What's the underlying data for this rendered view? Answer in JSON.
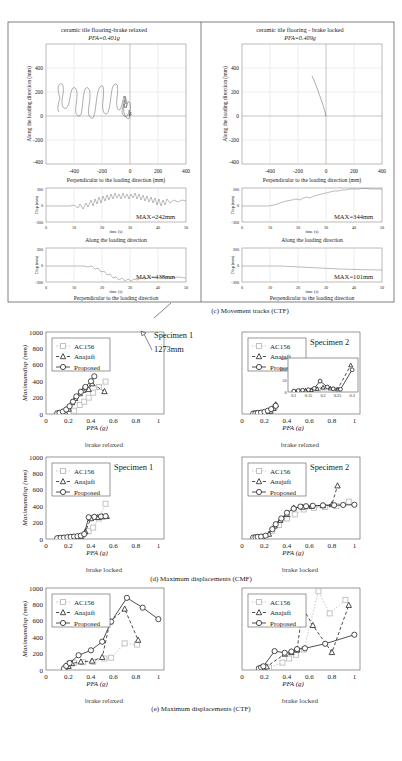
{
  "figure": {
    "panel_c_caption": "(c) Movement tracks (CTF)",
    "panel_d_caption": "(d) Maximum displacements (CMF)",
    "panel_e_caption": "(e) Maximum displacements (CTF)"
  },
  "tracks": {
    "left": {
      "title": "ceramic tile flooring-brake relaxed",
      "pfa": "PFA=0.401g",
      "ylabel": "Along the loading direction (mm)",
      "xlabel": "Perpendicular to the loading direction (mm)",
      "xticks": [
        "-400",
        "-200",
        "0",
        "200",
        "400"
      ],
      "yticks": [
        "400",
        "200",
        "0",
        "-200",
        "-400"
      ],
      "ts_along": {
        "max_label": "MAX=242mm",
        "caption": "Along the loading direction",
        "ylabel": "Disp (mm)",
        "xlabel": "time (s)",
        "yticks": [
          "300",
          "0",
          "-300"
        ],
        "xticks": [
          "0",
          "10",
          "20",
          "30",
          "40",
          "50"
        ]
      },
      "ts_perp": {
        "max_label": "MAX=438mm",
        "caption": "Perpendicular to the loading direction",
        "ylabel": "Disp (mm)",
        "xlabel": "time (s)",
        "yticks": [
          "300",
          "0",
          "-300"
        ],
        "xticks": [
          "0",
          "10",
          "20",
          "30",
          "40",
          "50"
        ]
      }
    },
    "right": {
      "title": "ceramic tile flooring - brake locked",
      "pfa": "PFA=0.409g",
      "ylabel": "Along the loading direction (mm)",
      "xlabel": "Perpendicular to the loading direction (mm)",
      "xticks": [
        "-400",
        "-200",
        "0",
        "200",
        "400"
      ],
      "yticks": [
        "400",
        "200",
        "0",
        "-200",
        "-400"
      ],
      "ts_along": {
        "max_label": "MAX=344mm",
        "caption": "Along the loading direction",
        "ylabel": "Disp (mm)",
        "xlabel": "time (s)",
        "yticks": [
          "300",
          "0",
          "-300"
        ],
        "xticks": [
          "0",
          "10",
          "20",
          "30",
          "40",
          "50"
        ]
      },
      "ts_perp": {
        "max_label": "MAX=101mm",
        "caption": "Perpendicular to the loading direction",
        "ylabel": "Disp (mm)",
        "xlabel": "time (s)",
        "yticks": [
          "300",
          "0",
          "-300"
        ],
        "xticks": [
          "0",
          "10",
          "20",
          "30",
          "40",
          "50"
        ]
      }
    }
  },
  "legend": {
    "ac156": "AC156",
    "anajafi": "Anajafi",
    "proposed": "Proposed"
  },
  "annotations": {
    "specimen1": "Specimen 1",
    "specimen2": "Specimen 2",
    "value_1273": "1273mm",
    "brake_relaxed": "brake relaxed",
    "brake_locked": "brake locked"
  },
  "axes": {
    "ylabel": "Maximumdisp (mm)",
    "xlabel": "PFA (g)",
    "xticks": [
      "0",
      "0.2",
      "0.4",
      "0.6",
      "0.8",
      "1"
    ],
    "yticks": [
      "0",
      "200",
      "400",
      "600",
      "800",
      "1000"
    ],
    "xlim": [
      0,
      1.05
    ],
    "ylim": [
      0,
      1000
    ]
  },
  "inset": {
    "xticks": [
      "0.1",
      "0.15",
      "0.2",
      "0.25",
      "0.3"
    ],
    "yticks": [
      "0",
      "50",
      "100",
      "150"
    ],
    "xlim": [
      0.08,
      0.32
    ],
    "ylim": [
      0,
      150
    ]
  },
  "colors": {
    "proposed": "#222222",
    "anajafi": "#222222",
    "ac156": "#bdbdbd",
    "frame": "#555555",
    "grid": "#cfcfcf"
  },
  "chart_data": [
    {
      "id": "d-s1-relaxed",
      "type": "scatter",
      "title": "Specimen 1 - brake relaxed (CMF)",
      "xlabel": "PFA (g)",
      "ylabel": "Maximumdisp (mm)",
      "xlim": [
        0,
        1.05
      ],
      "ylim": [
        0,
        1000
      ],
      "series": [
        {
          "name": "Proposed",
          "x": [
            0.1,
            0.12,
            0.15,
            0.18,
            0.21,
            0.24,
            0.27,
            0.31,
            0.35,
            0.4,
            0.43
          ],
          "y": [
            8,
            15,
            30,
            55,
            95,
            150,
            215,
            270,
            330,
            400,
            460
          ]
        },
        {
          "name": "Anajafi",
          "x": [
            0.11,
            0.14,
            0.17,
            0.2,
            0.23,
            0.26,
            0.3,
            0.33,
            0.38,
            0.41,
            0.52
          ],
          "y": [
            5,
            12,
            25,
            60,
            140,
            190,
            250,
            290,
            300,
            370,
            275
          ]
        },
        {
          "name": "AC156",
          "x": [
            0.12,
            0.16,
            0.2,
            0.25,
            0.3,
            0.34,
            0.38,
            0.42,
            0.47,
            0.53
          ],
          "y": [
            4,
            10,
            20,
            40,
            110,
            150,
            200,
            260,
            330,
            395
          ]
        }
      ]
    },
    {
      "id": "d-s2-relaxed",
      "type": "scatter",
      "title": "Specimen 2 - brake relaxed (CMF)",
      "xlabel": "PFA (g)",
      "ylabel": "Maximumdisp (mm)",
      "xlim": [
        0,
        1.05
      ],
      "ylim": [
        0,
        1000
      ],
      "series": [
        {
          "name": "Proposed",
          "x": [
            0.1,
            0.12,
            0.14,
            0.17,
            0.2,
            0.23,
            0.26,
            0.3
          ],
          "y": [
            5,
            8,
            12,
            18,
            25,
            40,
            60,
            100
          ]
        },
        {
          "name": "Anajafi",
          "x": [
            0.11,
            0.13,
            0.16,
            0.19,
            0.22,
            0.25,
            0.28,
            0.3
          ],
          "y": [
            4,
            7,
            10,
            14,
            22,
            35,
            70,
            115
          ]
        },
        {
          "name": "AC156",
          "x": [
            0.11,
            0.14,
            0.18,
            0.22,
            0.26,
            0.29
          ],
          "y": [
            3,
            6,
            9,
            15,
            30,
            80
          ]
        }
      ],
      "inset": {
        "xlim": [
          0.08,
          0.32
        ],
        "ylim": [
          0,
          150
        ],
        "xticks": [
          "0.1",
          "0.15",
          "0.2",
          "0.25",
          "0.3"
        ],
        "yticks": [
          "0",
          "50",
          "100",
          "150"
        ],
        "series": [
          {
            "name": "Proposed",
            "x": [
              0.1,
              0.115,
              0.13,
              0.15,
              0.17,
              0.19,
              0.215,
              0.235,
              0.26,
              0.3
            ],
            "y": [
              4,
              6,
              8,
              10,
              16,
              48,
              22,
              14,
              12,
              98
            ]
          },
          {
            "name": "Anajafi",
            "x": [
              0.1,
              0.12,
              0.14,
              0.16,
              0.18,
              0.2,
              0.225,
              0.25,
              0.295
            ],
            "y": [
              3,
              5,
              7,
              9,
              14,
              20,
              16,
              12,
              118
            ]
          },
          {
            "name": "AC156",
            "x": [
              0.105,
              0.125,
              0.155,
              0.185,
              0.205,
              0.24
            ],
            "y": [
              3,
              4,
              6,
              11,
              17,
              13
            ]
          }
        ]
      }
    },
    {
      "id": "d-s1-locked",
      "type": "scatter",
      "title": "Specimen 1 - brake locked (CMF)",
      "xlabel": "PFA (g)",
      "ylabel": "Maximumdisp (mm)",
      "xlim": [
        0,
        1.05
      ],
      "ylim": [
        0,
        1000
      ],
      "series": [
        {
          "name": "Proposed",
          "x": [
            0.1,
            0.13,
            0.16,
            0.19,
            0.22,
            0.25,
            0.28,
            0.31,
            0.34,
            0.38,
            0.43,
            0.49,
            0.53
          ],
          "y": [
            10,
            14,
            18,
            22,
            26,
            30,
            34,
            40,
            60,
            265,
            270,
            275,
            278
          ]
        },
        {
          "name": "Anajafi",
          "x": [
            0.11,
            0.15,
            0.19,
            0.23,
            0.27,
            0.31,
            0.35,
            0.4,
            0.46,
            0.5,
            0.54
          ],
          "y": [
            8,
            12,
            16,
            20,
            24,
            30,
            90,
            250,
            265,
            272,
            276
          ]
        },
        {
          "name": "AC156",
          "x": [
            0.12,
            0.17,
            0.22,
            0.27,
            0.32,
            0.38,
            0.42,
            0.47,
            0.53
          ],
          "y": [
            6,
            10,
            16,
            22,
            28,
            95,
            140,
            250,
            430
          ]
        }
      ]
    },
    {
      "id": "d-s2-locked",
      "type": "scatter",
      "title": "Specimen 2 - brake locked (CMF)",
      "xlabel": "PFA (g)",
      "ylabel": "Maximumdisp (mm)",
      "xlim": [
        0,
        1.05
      ],
      "ylim": [
        0,
        1000
      ],
      "series": [
        {
          "name": "Proposed",
          "x": [
            0.1,
            0.12,
            0.14,
            0.17,
            0.21,
            0.27,
            0.3,
            0.35,
            0.4,
            0.46,
            0.52,
            0.57,
            0.63,
            0.72,
            0.82,
            0.9,
            1.0
          ],
          "y": [
            18,
            22,
            26,
            30,
            40,
            120,
            180,
            250,
            320,
            370,
            395,
            400,
            405,
            410,
            412,
            415,
            418
          ]
        },
        {
          "name": "Anajafi",
          "x": [
            0.11,
            0.14,
            0.18,
            0.24,
            0.29,
            0.34,
            0.4,
            0.46,
            0.54,
            0.62,
            0.72,
            0.8,
            0.85
          ],
          "y": [
            14,
            20,
            25,
            60,
            160,
            230,
            300,
            380,
            390,
            400,
            408,
            420,
            650
          ]
        },
        {
          "name": "AC156",
          "x": [
            0.12,
            0.16,
            0.21,
            0.27,
            0.33,
            0.4,
            0.47,
            0.55,
            0.64,
            0.74,
            0.84,
            0.95
          ],
          "y": [
            10,
            16,
            24,
            100,
            170,
            250,
            300,
            360,
            380,
            390,
            400,
            455
          ]
        }
      ]
    },
    {
      "id": "e-relaxed",
      "type": "scatter",
      "title": "brake relaxed (CTF)",
      "xlabel": "PFA (g)",
      "ylabel": "Maximumdisp (mm)",
      "xlim": [
        0,
        1.05
      ],
      "ylim": [
        0,
        1000
      ],
      "annotation": "1273mm",
      "series": [
        {
          "name": "Proposed",
          "x": [
            0.16,
            0.18,
            0.21,
            0.29,
            0.4,
            0.5,
            0.58,
            0.72,
            0.86,
            1.0
          ],
          "y": [
            20,
            50,
            85,
            180,
            240,
            345,
            590,
            880,
            760,
            620
          ]
        },
        {
          "name": "Anajafi",
          "x": [
            0.17,
            0.2,
            0.23,
            0.31,
            0.41,
            0.5,
            0.57,
            0.7,
            0.82
          ],
          "y": [
            18,
            45,
            80,
            100,
            110,
            155,
            590,
            745,
            365
          ]
        },
        {
          "name": "AC156",
          "x": [
            0.17,
            0.21,
            0.25,
            0.33,
            0.42,
            0.52,
            0.58,
            0.7,
            0.81
          ],
          "y": [
            15,
            80,
            90,
            95,
            100,
            140,
            150,
            325,
            310
          ]
        }
      ]
    },
    {
      "id": "e-locked",
      "type": "scatter",
      "title": "brake locked (CTF)",
      "xlabel": "PFA (g)",
      "ylabel": "Maximumdisp (mm)",
      "xlim": [
        0,
        1.05
      ],
      "ylim": [
        0,
        1000
      ],
      "series": [
        {
          "name": "Proposed",
          "x": [
            0.15,
            0.17,
            0.19,
            0.29,
            0.38,
            0.44,
            0.49,
            0.56,
            0.74,
            1.0
          ],
          "y": [
            20,
            30,
            45,
            230,
            210,
            225,
            255,
            265,
            320,
            430
          ]
        },
        {
          "name": "Anajafi",
          "x": [
            0.16,
            0.19,
            0.22,
            0.38,
            0.44,
            0.49,
            0.54,
            0.63,
            0.8,
            0.95
          ],
          "y": [
            15,
            25,
            40,
            195,
            215,
            245,
            760,
            545,
            215,
            790
          ]
        },
        {
          "name": "AC156",
          "x": [
            0.17,
            0.2,
            0.24,
            0.36,
            0.42,
            0.48,
            0.55,
            0.68,
            0.78,
            0.92
          ],
          "y": [
            10,
            18,
            30,
            90,
            140,
            185,
            250,
            960,
            690,
            855
          ]
        }
      ]
    }
  ]
}
